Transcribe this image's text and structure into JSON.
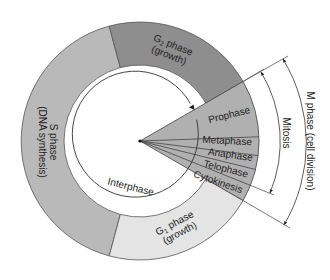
{
  "diagram": {
    "type": "cell-cycle",
    "colors": {
      "s_phase": "#b9b9b9",
      "g2_phase": "#8e8e8e",
      "g1_phase": "#e4e4e4",
      "mitosis_wedge": "#b0b0b0",
      "outline": "#444444",
      "background": "#ffffff"
    },
    "segments": {
      "g2": {
        "line1": "G",
        "sub": "2",
        "line1_rest": " phase",
        "line2": "(growth)"
      },
      "s": {
        "line1": "S phase",
        "line2": "(DNA synthesis)"
      },
      "g1": {
        "line1": "G",
        "sub": "1",
        "line1_rest": " phase",
        "line2": "(growth)"
      }
    },
    "center_label": "Interphase",
    "mitosis_stages": [
      "Prophase",
      "Metaphase",
      "Anaphase",
      "Telophase",
      "Cytokinesis"
    ],
    "brackets": {
      "mitosis": "Mitosis",
      "m_phase": "M phase (cell division)"
    }
  }
}
